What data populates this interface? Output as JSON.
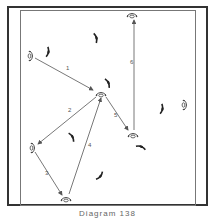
{
  "caption": "Diagram 138",
  "colors": {
    "border": "#333333",
    "line": "#555555",
    "player": "#444444",
    "defender": "#222222",
    "label": "#555555"
  },
  "players": [
    {
      "id": "p1",
      "x": 31,
      "y": 56,
      "orient": "v"
    },
    {
      "id": "p2",
      "x": 101,
      "y": 94,
      "orient": "h"
    },
    {
      "id": "p3",
      "x": 132,
      "y": 15,
      "orient": "h"
    },
    {
      "id": "p4",
      "x": 33,
      "y": 148,
      "orient": "v"
    },
    {
      "id": "p5",
      "x": 66,
      "y": 199,
      "orient": "h"
    },
    {
      "id": "p6",
      "x": 133,
      "y": 135,
      "orient": "h"
    },
    {
      "id": "p7",
      "x": 185,
      "y": 105,
      "orient": "v"
    }
  ],
  "defenders": [
    {
      "x": 48,
      "y": 52,
      "rot": 10
    },
    {
      "x": 96,
      "y": 38,
      "rot": -15
    },
    {
      "x": 108,
      "y": 83,
      "rot": -25
    },
    {
      "x": 162,
      "y": 109,
      "rot": 10
    },
    {
      "x": 72,
      "y": 137,
      "rot": -30
    },
    {
      "x": 141,
      "y": 147,
      "rot": -70
    },
    {
      "x": 100,
      "y": 176,
      "rot": 40
    }
  ],
  "passes": [
    {
      "label": "1",
      "x1": 35,
      "y1": 58,
      "x2": 93,
      "y2": 90,
      "lx": 66,
      "ly": 70
    },
    {
      "label": "2",
      "x1": 96,
      "y1": 97,
      "x2": 38,
      "y2": 144,
      "lx": 68,
      "ly": 112
    },
    {
      "label": "3",
      "x1": 35,
      "y1": 152,
      "x2": 62,
      "y2": 195,
      "lx": 45,
      "ly": 175
    },
    {
      "label": "4",
      "x1": 69,
      "y1": 194,
      "x2": 101,
      "y2": 98,
      "lx": 88,
      "ly": 147
    },
    {
      "label": "5",
      "x1": 106,
      "y1": 97,
      "x2": 128,
      "y2": 130,
      "lx": 114,
      "ly": 117
    },
    {
      "label": "6",
      "x1": 134,
      "y1": 130,
      "x2": 134,
      "y2": 20,
      "lx": 130,
      "ly": 64
    }
  ]
}
